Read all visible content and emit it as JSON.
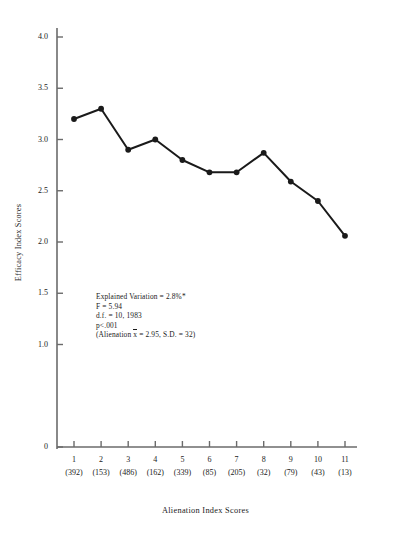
{
  "chart_data": {
    "type": "line",
    "title": "",
    "xlabel": "Alienation Index Scores",
    "ylabel": "Efficacy Index Scores",
    "categories": [
      "1",
      "2",
      "3",
      "4",
      "5",
      "6",
      "7",
      "8",
      "9",
      "10",
      "11"
    ],
    "counts": [
      "(392)",
      "(153)",
      "(486)",
      "(162)",
      "(339)",
      "(85)",
      "(205)",
      "(32)",
      "(79)",
      "(43)",
      "(13)"
    ],
    "values": [
      3.2,
      3.3,
      2.9,
      3.0,
      2.8,
      2.68,
      2.68,
      2.87,
      2.59,
      2.4,
      2.06
    ],
    "ylim": [
      0,
      4.0
    ],
    "yticks": [
      "0",
      "1.0",
      "1.5",
      "2.0",
      "2.5",
      "3.0",
      "3.5",
      "4.0"
    ],
    "ytick_values": [
      0,
      1.0,
      1.5,
      2.0,
      2.5,
      3.0,
      3.5,
      4.0
    ],
    "grid": false,
    "legend": false,
    "marker": "filled-circle",
    "line_color": "#1a1a1a",
    "marker_color": "#1a1a1a",
    "axis_color": "#6b6b6b"
  },
  "annotation": {
    "line1": "Explained Variation  =  2.8%*",
    "line2": "F  =  5.94",
    "line3": "d.f.  =  10, 1983",
    "line4": "p<.001",
    "line5_prefix": "(Alienation  ",
    "line5_xbar": "x",
    "line5_suffix": "  =  2.95,  S.D.  =  32)"
  }
}
